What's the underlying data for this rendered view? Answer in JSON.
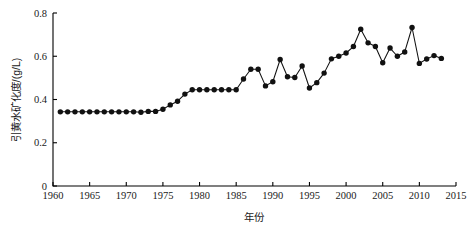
{
  "chart_data": {
    "type": "line",
    "title": "",
    "xlabel": "年份",
    "ylabel": "引黄水矿化度/(g/L)",
    "xlim": [
      1960,
      2015
    ],
    "ylim": [
      0,
      0.8
    ],
    "xticks": [
      1960,
      1965,
      1970,
      1975,
      1980,
      1985,
      1990,
      1995,
      2000,
      2005,
      2010,
      2015
    ],
    "yticks": [
      0,
      0.2,
      0.4,
      0.6,
      0.8
    ],
    "ytick_labels": [
      "0",
      "0.2",
      "0.4",
      "0.6",
      "0.8"
    ],
    "xtick_labels": [
      "1960",
      "1965",
      "1970",
      "1975",
      "1980",
      "1985",
      "1990",
      "1995",
      "2000",
      "2005",
      "2010",
      "2015"
    ],
    "grid": false,
    "legend": null,
    "marker": "filled-circle",
    "series": [
      {
        "name": "引黄水矿化度",
        "x": [
          1961,
          1962,
          1963,
          1964,
          1965,
          1966,
          1967,
          1968,
          1969,
          1970,
          1971,
          1972,
          1973,
          1974,
          1975,
          1976,
          1977,
          1978,
          1979,
          1980,
          1981,
          1982,
          1983,
          1984,
          1985,
          1986,
          1987,
          1988,
          1989,
          1990,
          1991,
          1992,
          1993,
          1994,
          1995,
          1996,
          1997,
          1998,
          1999,
          2000,
          2001,
          2002,
          2003,
          2004,
          2005,
          2006,
          2007,
          2008,
          2009,
          2010,
          2011,
          2012,
          2013
        ],
        "values": [
          0.343,
          0.343,
          0.343,
          0.343,
          0.343,
          0.343,
          0.343,
          0.343,
          0.343,
          0.343,
          0.343,
          0.341,
          0.345,
          0.345,
          0.355,
          0.375,
          0.392,
          0.425,
          0.445,
          0.445,
          0.445,
          0.445,
          0.445,
          0.445,
          0.445,
          0.495,
          0.54,
          0.54,
          0.463,
          0.482,
          0.585,
          0.505,
          0.502,
          0.555,
          0.453,
          0.478,
          0.522,
          0.588,
          0.6,
          0.615,
          0.645,
          0.725,
          0.662,
          0.645,
          0.57,
          0.638,
          0.6,
          0.62,
          0.733,
          0.567,
          0.587,
          0.603,
          0.59
        ]
      }
    ]
  },
  "figure": {
    "background_color": "#ffffff",
    "line_color": "#111111",
    "axis_color": "#000000"
  }
}
